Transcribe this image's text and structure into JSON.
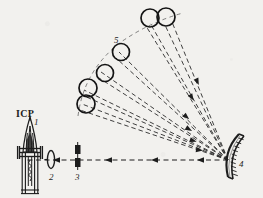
{
  "figure": {
    "background_color": "#f2f1ee",
    "ink_color": "#1d1d1d"
  },
  "labels": {
    "source_name": "ICP",
    "item_1": "1",
    "item_2": "2",
    "item_3": "3",
    "item_4": "4",
    "item_5": "5"
  },
  "components": [
    {
      "id": "1",
      "name": "icp-torch",
      "label": "1",
      "x": 33,
      "y": 155
    },
    {
      "id": "2",
      "name": "focusing-lens",
      "label": "2",
      "x": 55,
      "y": 161
    },
    {
      "id": "3",
      "name": "entrance-slit",
      "label": "3",
      "x": 78,
      "y": 161
    },
    {
      "id": "4",
      "name": "concave-grating",
      "label": "4",
      "x": 233,
      "y": 161
    },
    {
      "id": "5",
      "name": "detector-array",
      "label": "5",
      "x": 119,
      "y": 66
    }
  ],
  "detectors": [
    {
      "index": 1,
      "cx": 86,
      "cy": 104,
      "r": 9.0
    },
    {
      "index": 2,
      "cx": 88,
      "cy": 88,
      "r": 9.0
    },
    {
      "index": 3,
      "cx": 105,
      "cy": 73,
      "r": 8.5
    },
    {
      "index": 4,
      "cx": 121,
      "cy": 52,
      "r": 8.5
    },
    {
      "index": 5,
      "cx": 150,
      "cy": 18,
      "r": 9.0
    },
    {
      "index": 6,
      "cx": 166,
      "cy": 17,
      "r": 9.0
    }
  ],
  "grating": {
    "name": "concave-diffraction-grating",
    "apex_x": 228,
    "apex_y": 160,
    "groove_count": 11
  },
  "beam": {
    "name": "optical-axis",
    "style": "dashed",
    "from_x": 24,
    "to_x": 228,
    "y": 160,
    "arrow_count": 4,
    "arrow_direction": "left"
  },
  "rays": {
    "name": "diffracted-rays",
    "style": "dashed",
    "origin_x": 228,
    "origin_y": 160,
    "count": 6
  }
}
